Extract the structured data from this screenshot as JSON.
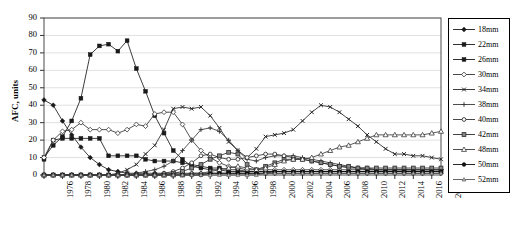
{
  "chart_data": {
    "type": "line",
    "title": "",
    "xlabel": "",
    "ylabel": "AFC, units",
    "ylim": [
      0,
      90
    ],
    "ytick_step": 10,
    "yticks": [
      0,
      10,
      20,
      30,
      40,
      50,
      60,
      70,
      80,
      90
    ],
    "xlim": [
      1976,
      2019
    ],
    "grid": "horizontal",
    "legend_position": "right-outside",
    "x": [
      1976,
      1977,
      1978,
      1979,
      1980,
      1981,
      1982,
      1983,
      1984,
      1985,
      1986,
      1987,
      1988,
      1989,
      1990,
      1991,
      1992,
      1993,
      1994,
      1995,
      1996,
      1997,
      1998,
      1999,
      2000,
      2001,
      2002,
      2003,
      2004,
      2005,
      2006,
      2007,
      2008,
      2009,
      2010,
      2011,
      2012,
      2013,
      2014,
      2015,
      2016,
      2017,
      2018,
      2019
    ],
    "xticks": [
      1976,
      1978,
      1980,
      1982,
      1984,
      1986,
      1988,
      1990,
      1992,
      1994,
      1996,
      1998,
      2000,
      2002,
      2004,
      2006,
      2008,
      2010,
      2012,
      2014,
      2016,
      2018
    ],
    "series": [
      {
        "name": "18mm",
        "marker": "diamond-filled",
        "dash": "solid",
        "color": "#1a1a1a",
        "values": [
          43,
          40,
          31,
          23,
          16,
          10,
          6,
          3,
          2,
          1,
          1,
          1,
          1,
          1,
          1,
          1,
          1,
          1,
          1,
          1,
          1,
          1,
          1,
          1,
          1,
          1,
          1,
          1,
          1,
          1,
          1,
          1,
          1,
          1,
          1,
          1,
          1,
          1,
          1,
          1,
          1,
          1,
          1,
          1
        ]
      },
      {
        "name": "22mm",
        "marker": "square-filled",
        "dash": "solid",
        "color": "#1a1a1a",
        "values": [
          9,
          20,
          21,
          21,
          21,
          21,
          21,
          11,
          11,
          11,
          11,
          9,
          8,
          8,
          8,
          7,
          6,
          5,
          4,
          4,
          3,
          3,
          2,
          2,
          2,
          2,
          2,
          2,
          2,
          2,
          2,
          2,
          2,
          2,
          2,
          2,
          2,
          2,
          2,
          2,
          2,
          2,
          2,
          2
        ]
      },
      {
        "name": "26mm",
        "marker": "square-filled",
        "dash": "solid",
        "color": "#1a1a1a",
        "values": [
          10,
          17,
          22,
          31,
          44,
          69,
          74,
          75,
          71,
          77,
          61,
          48,
          34,
          24,
          14,
          9,
          5,
          4,
          3,
          3,
          2,
          2,
          2,
          2,
          2,
          2,
          2,
          2,
          2,
          2,
          2,
          2,
          2,
          2,
          2,
          2,
          2,
          2,
          2,
          2,
          2,
          2,
          2,
          2
        ]
      },
      {
        "name": "30mm",
        "marker": "diamond-open",
        "dash": "solid",
        "color": "#333333",
        "values": [
          10,
          20,
          25,
          26,
          30,
          26,
          26,
          26,
          24,
          26,
          29,
          28,
          35,
          36,
          36,
          29,
          20,
          14,
          10,
          7,
          5,
          4,
          3,
          3,
          3,
          3,
          3,
          3,
          3,
          3,
          3,
          3,
          3,
          3,
          3,
          3,
          3,
          3,
          3,
          3,
          3,
          3,
          3,
          3
        ]
      },
      {
        "name": "34mm",
        "marker": "x-cross",
        "dash": "solid",
        "color": "#262626",
        "values": [
          0,
          0,
          0,
          0,
          0,
          0,
          0,
          0,
          1,
          3,
          6,
          12,
          17,
          26,
          38,
          39,
          38,
          39,
          34,
          27,
          19,
          14,
          10,
          15,
          22,
          23,
          24,
          26,
          31,
          36,
          40,
          39,
          36,
          32,
          28,
          23,
          19,
          15,
          12,
          12,
          11,
          11,
          10,
          9
        ]
      },
      {
        "name": "38mm",
        "marker": "plus",
        "dash": "solid",
        "color": "#3a3a3a",
        "values": [
          0,
          0,
          0,
          0,
          0,
          0,
          0,
          0,
          0,
          0,
          1,
          2,
          3,
          5,
          8,
          14,
          20,
          26,
          27,
          25,
          20,
          14,
          9,
          8,
          10,
          11,
          11,
          11,
          10,
          9,
          8,
          7,
          6,
          5,
          4,
          4,
          3,
          3,
          3,
          3,
          3,
          3,
          3,
          3
        ]
      },
      {
        "name": "40mm",
        "marker": "circle-open",
        "dash": "solid",
        "color": "#333333",
        "values": [
          0,
          0,
          0,
          0,
          0,
          0,
          0,
          0,
          0,
          0,
          0,
          0,
          0,
          1,
          2,
          4,
          7,
          11,
          12,
          10,
          9,
          9,
          10,
          11,
          12,
          12,
          11,
          10,
          9,
          8,
          7,
          6,
          5,
          4,
          4,
          3,
          3,
          3,
          3,
          3,
          3,
          3,
          3,
          3
        ]
      },
      {
        "name": "42mm",
        "marker": "square-half",
        "dash": "solid",
        "color": "#2b2b2b",
        "values": [
          0,
          0,
          0,
          0,
          0,
          0,
          0,
          0,
          0,
          0,
          0,
          0,
          0,
          0,
          1,
          2,
          4,
          6,
          9,
          11,
          13,
          12,
          6,
          3,
          5,
          7,
          9,
          9,
          9,
          8,
          7,
          6,
          5,
          5,
          4,
          4,
          4,
          4,
          4,
          4,
          4,
          4,
          4,
          4
        ]
      },
      {
        "name": "48mm",
        "marker": "triangle-open",
        "dash": "solid",
        "color": "#3a3a3a",
        "values": [
          0,
          0,
          0,
          0,
          0,
          0,
          0,
          0,
          0,
          0,
          0,
          0,
          0,
          0,
          0,
          0,
          1,
          1,
          2,
          3,
          4,
          5,
          4,
          3,
          4,
          6,
          8,
          9,
          9,
          10,
          12,
          14,
          16,
          17,
          19,
          21,
          23,
          23,
          23,
          23,
          23,
          23,
          24,
          25
        ]
      },
      {
        "name": "50mm",
        "marker": "circle-filled",
        "dash": "solid",
        "color": "#111111",
        "values": [
          0,
          0,
          0,
          0,
          0,
          0,
          0,
          0,
          0,
          0,
          0,
          0,
          0,
          0,
          0,
          0,
          0,
          0,
          1,
          1,
          1,
          1,
          1,
          1,
          1,
          2,
          2,
          2,
          2,
          2,
          2,
          2,
          2,
          2,
          2,
          2,
          2,
          2,
          2,
          2,
          2,
          2,
          2,
          2
        ]
      },
      {
        "name": "52mm",
        "marker": "triangle-small",
        "dash": "solid",
        "color": "#555555",
        "values": [
          0,
          0,
          0,
          0,
          0,
          0,
          0,
          0,
          0,
          0,
          0,
          0,
          0,
          0,
          0,
          0,
          0,
          0,
          0,
          0,
          0,
          0,
          0,
          0,
          1,
          1,
          1,
          1,
          1,
          1,
          1,
          1,
          1,
          1,
          1,
          1,
          1,
          1,
          1,
          1,
          1,
          1,
          1,
          1
        ]
      }
    ]
  },
  "axes": {
    "y_title": "AFC, units"
  },
  "legend": {
    "entries": [
      {
        "label": "18mm"
      },
      {
        "label": "22mm"
      },
      {
        "label": "26mm"
      },
      {
        "label": "30mm"
      },
      {
        "label": "34mm"
      },
      {
        "label": "38mm"
      },
      {
        "label": "40mm"
      },
      {
        "label": "42mm"
      },
      {
        "label": "48mm"
      },
      {
        "label": "50mm"
      },
      {
        "label": "52mm"
      }
    ]
  }
}
